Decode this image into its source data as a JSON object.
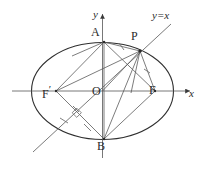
{
  "figure": {
    "background_color": "#ffffff",
    "stroke_color": "#3a3a3a",
    "thin_stroke_color": "#555555",
    "label_color": "#2b2b2b"
  },
  "axes": {
    "x_label": "x",
    "y_label": "y",
    "origin_label": "O",
    "x_axis": {
      "y": 91,
      "x_start": 12,
      "x_end": 194,
      "arrow": true
    },
    "y_axis": {
      "x": 102.5,
      "y_start": 158,
      "y_end": 11,
      "arrow": true
    }
  },
  "ellipse": {
    "center": [
      102.5,
      91
    ],
    "rx": 71,
    "ry": 48.5
  },
  "line_yx": {
    "label": "y=x",
    "from": [
      33,
      152
    ],
    "to": [
      173,
      22
    ]
  },
  "points": [
    {
      "name": "A",
      "label": "A",
      "x": 104,
      "y": 42,
      "label_x": 91,
      "label_y": 28
    },
    {
      "name": "B",
      "label": "B",
      "x": 104,
      "y": 139,
      "label_x": 97,
      "label_y": 142
    },
    {
      "name": "P",
      "label": "P",
      "x": 140,
      "y": 51,
      "label_x": 133,
      "label_y": 33
    },
    {
      "name": "F1",
      "label": "F",
      "prime": true,
      "x": 56,
      "y": 91,
      "label_x": 44,
      "label_y": 85
    },
    {
      "name": "F2",
      "label": "F",
      "prime": false,
      "x": 155,
      "y": 91,
      "label_x": 150,
      "label_y": 85
    },
    {
      "name": "O",
      "label": "O",
      "x": 102.5,
      "y": 91,
      "label_x": 93,
      "label_y": 86
    }
  ],
  "segments": [
    {
      "name": "A-to-P",
      "from": [
        104,
        42
      ],
      "to": [
        140,
        51
      ]
    },
    {
      "name": "A-to-F-right",
      "from": [
        104,
        42
      ],
      "to": [
        155,
        91
      ]
    },
    {
      "name": "A-to-F-left",
      "from": [
        104,
        42
      ],
      "to": [
        56,
        91
      ]
    },
    {
      "name": "A-to-B",
      "from": [
        104,
        42
      ],
      "to": [
        104,
        139
      ]
    },
    {
      "name": "P-to-F-left",
      "from": [
        140,
        51
      ],
      "to": [
        56,
        91
      ]
    },
    {
      "name": "P-to-F-right",
      "from": [
        140,
        51
      ],
      "to": [
        155,
        91
      ]
    },
    {
      "name": "P-to-B",
      "from": [
        140,
        51
      ],
      "to": [
        104,
        139
      ]
    },
    {
      "name": "P-to-O",
      "from": [
        140,
        51
      ],
      "to": [
        102.5,
        91
      ]
    },
    {
      "name": "F-left-to-B",
      "from": [
        56,
        91
      ],
      "to": [
        104,
        139
      ]
    },
    {
      "name": "F-right-to-B",
      "from": [
        155,
        91
      ],
      "to": [
        104,
        139
      ]
    },
    {
      "name": "A-chord-short",
      "from": [
        104,
        42
      ],
      "to": [
        76,
        55
      ]
    },
    {
      "name": "F-left-to-A-ext",
      "from": [
        56,
        91
      ],
      "to": [
        104,
        42
      ]
    }
  ],
  "tick_marks": [
    {
      "name": "tick-on-AP",
      "x": 122,
      "y": 47,
      "angle": 15
    },
    {
      "name": "tick-on-PF-right",
      "x": 147,
      "y": 71,
      "angle": 70
    },
    {
      "name": "tick-on-FB-left",
      "x": 76,
      "y": 110,
      "angle": 45
    },
    {
      "name": "tick-on-yx-lower",
      "x": 64,
      "y": 121,
      "angle": -45
    },
    {
      "name": "tick-on-yx-upper",
      "x": 88,
      "y": 128,
      "angle": 45
    }
  ],
  "right_angle_marker": {
    "name": "perpendicular-marker",
    "x": 77,
    "y": 113,
    "size": 6
  }
}
